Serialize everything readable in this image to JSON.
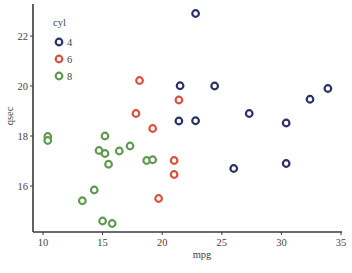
{
  "chart_data": {
    "type": "scatter",
    "title": "",
    "xlabel": "mpg",
    "ylabel": "qsec",
    "xlim": [
      9.2,
      35.1
    ],
    "ylim": [
      14.1,
      23.2
    ],
    "xticks": [
      10,
      15,
      20,
      25,
      30,
      35
    ],
    "yticks": [
      16,
      18,
      20,
      22
    ],
    "grid": false,
    "legend": {
      "title": "cyl",
      "placement": "top-left",
      "entries": [
        {
          "label": "4",
          "color": "#2b3166"
        },
        {
          "label": "6",
          "color": "#d9513c"
        },
        {
          "label": "8",
          "color": "#5f9a50"
        }
      ]
    },
    "series": [
      {
        "name": "4",
        "color": "#2b3166",
        "points": [
          {
            "x": 22.8,
            "y": 18.61
          },
          {
            "x": 24.4,
            "y": 20.0
          },
          {
            "x": 22.8,
            "y": 22.9
          },
          {
            "x": 32.4,
            "y": 19.47
          },
          {
            "x": 30.4,
            "y": 18.52
          },
          {
            "x": 33.9,
            "y": 19.9
          },
          {
            "x": 21.5,
            "y": 20.01
          },
          {
            "x": 27.3,
            "y": 18.9
          },
          {
            "x": 26.0,
            "y": 16.7
          },
          {
            "x": 30.4,
            "y": 16.9
          },
          {
            "x": 21.4,
            "y": 18.6
          }
        ]
      },
      {
        "name": "6",
        "color": "#d9513c",
        "points": [
          {
            "x": 21.0,
            "y": 16.46
          },
          {
            "x": 21.0,
            "y": 17.02
          },
          {
            "x": 21.4,
            "y": 19.44
          },
          {
            "x": 18.1,
            "y": 20.22
          },
          {
            "x": 19.2,
            "y": 18.3
          },
          {
            "x": 17.8,
            "y": 18.9
          },
          {
            "x": 19.7,
            "y": 15.5
          }
        ]
      },
      {
        "name": "8",
        "color": "#5f9a50",
        "points": [
          {
            "x": 18.7,
            "y": 17.02
          },
          {
            "x": 14.3,
            "y": 15.84
          },
          {
            "x": 16.4,
            "y": 17.4
          },
          {
            "x": 17.3,
            "y": 17.6
          },
          {
            "x": 15.2,
            "y": 18.0
          },
          {
            "x": 10.4,
            "y": 17.98
          },
          {
            "x": 10.4,
            "y": 17.82
          },
          {
            "x": 14.7,
            "y": 17.42
          },
          {
            "x": 15.5,
            "y": 16.87
          },
          {
            "x": 15.2,
            "y": 17.3
          },
          {
            "x": 13.3,
            "y": 15.41
          },
          {
            "x": 19.2,
            "y": 17.05
          },
          {
            "x": 15.8,
            "y": 14.5
          },
          {
            "x": 15.0,
            "y": 14.6
          }
        ]
      }
    ]
  }
}
